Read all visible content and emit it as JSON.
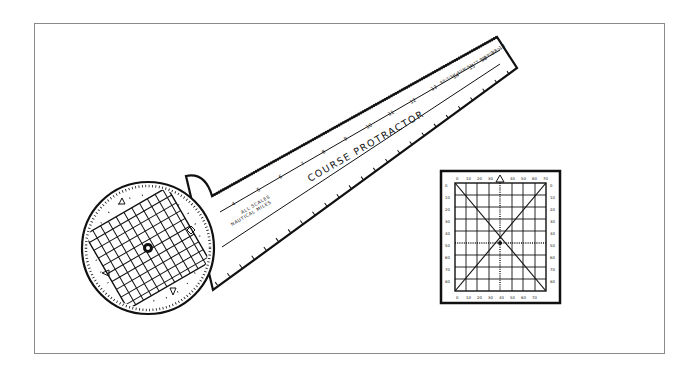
{
  "figure": {
    "course_protractor": {
      "title": "COURSE PROTRACTOR",
      "scale_note_line1": "ALL SCALES",
      "scale_note_line2": "NAUTICAL MILES",
      "end_note": "BRITISH ADMIRALTY STANDARD",
      "top_scale_numbers": [
        "4",
        "5",
        "6",
        "7",
        "8",
        "9",
        "10",
        "11",
        "12",
        "13",
        "14",
        "15",
        "16",
        "17",
        "18"
      ]
    },
    "square_protractor": {
      "top_labels": [
        "0",
        "10",
        "20",
        "30",
        "40",
        "50",
        "60",
        "70"
      ],
      "side_labels": [
        "0",
        "10",
        "20",
        "30",
        "40",
        "50",
        "60",
        "70",
        "80"
      ]
    }
  },
  "colors": {
    "ink": "#111111",
    "frame": "#8a8a8a",
    "paper": "#ffffff"
  }
}
